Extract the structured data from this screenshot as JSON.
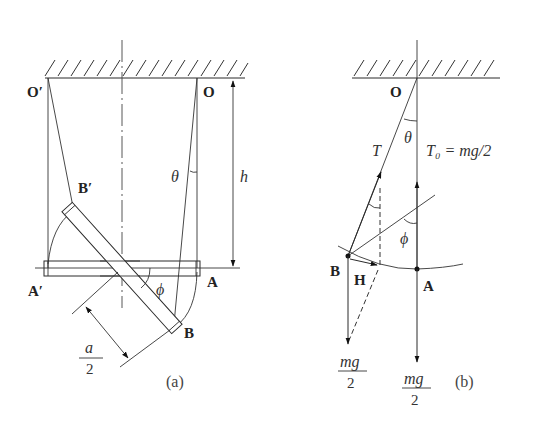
{
  "figure_a": {
    "caption": "(a)",
    "labels": {
      "O_prime": "O′",
      "O": "O",
      "B_prime": "B′",
      "A_prime": "A′",
      "A": "A",
      "B": "B",
      "theta": "θ",
      "phi": "ϕ",
      "h": "h",
      "half_a_num": "a",
      "half_a_den": "2"
    }
  },
  "figure_b": {
    "caption": "(b)",
    "labels": {
      "O": "O",
      "theta": "θ",
      "T": "T",
      "T0_eq": "T₀ = mg/2",
      "phi": "ϕ",
      "B": "B",
      "H": "H",
      "A": "A",
      "mg_num_B": "mg",
      "mg_den_B": "2",
      "mg_num_A": "mg",
      "mg_den_A": "2"
    }
  }
}
